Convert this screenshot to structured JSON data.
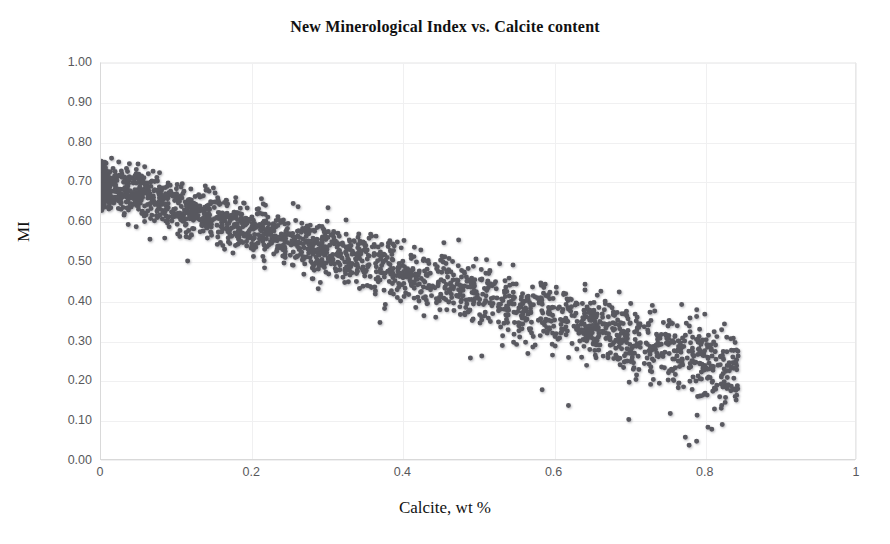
{
  "chart_data": {
    "type": "scatter",
    "title": "New Minerological Index vs. Calcite content",
    "xlabel": "Calcite, wt %",
    "ylabel": "MI",
    "xlim": [
      0,
      1
    ],
    "ylim": [
      0,
      1
    ],
    "grid": true,
    "legend": null,
    "marker": {
      "shape": "circle",
      "color": "#4d4d55",
      "size_px": 5,
      "shadow": true
    },
    "xticks": [
      "0",
      "0.2",
      "0.4",
      "0.6",
      "0.8",
      "1"
    ],
    "xtick_values": [
      0,
      0.2,
      0.4,
      0.6,
      0.8,
      1
    ],
    "yticks": [
      "0.00",
      "0.10",
      "0.20",
      "0.30",
      "0.40",
      "0.50",
      "0.60",
      "0.70",
      "0.80",
      "0.90",
      "1.00"
    ],
    "ytick_values": [
      0,
      0.1,
      0.2,
      0.3,
      0.4,
      0.5,
      0.6,
      0.7,
      0.8,
      0.9,
      1.0
    ],
    "n_points": 2600,
    "trend": {
      "type": "linear",
      "intercept": 0.695,
      "slope": -0.56,
      "band_halfwidth_at_x0": 0.065,
      "band_halfwidth_at_x08": 0.105
    },
    "x_range_observed": [
      0.0,
      0.845
    ],
    "y_range_observed": [
      0.03,
      0.805
    ],
    "outliers": [
      {
        "x": 0.37,
        "y": 0.345
      },
      {
        "x": 0.49,
        "y": 0.255
      },
      {
        "x": 0.505,
        "y": 0.26
      },
      {
        "x": 0.585,
        "y": 0.175
      },
      {
        "x": 0.62,
        "y": 0.135
      },
      {
        "x": 0.7,
        "y": 0.1
      },
      {
        "x": 0.755,
        "y": 0.115
      },
      {
        "x": 0.775,
        "y": 0.055
      },
      {
        "x": 0.78,
        "y": 0.035
      },
      {
        "x": 0.79,
        "y": 0.045
      },
      {
        "x": 0.805,
        "y": 0.08
      },
      {
        "x": 0.81,
        "y": 0.075
      },
      {
        "x": 0.845,
        "y": 0.26
      },
      {
        "x": 0.79,
        "y": 0.36
      },
      {
        "x": 0.065,
        "y": 0.555
      },
      {
        "x": 0.115,
        "y": 0.5
      },
      {
        "x": 0.175,
        "y": 0.52
      }
    ]
  }
}
